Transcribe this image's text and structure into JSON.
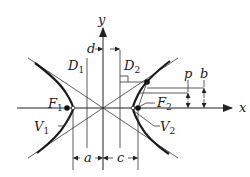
{
  "diagram": {
    "axes": {
      "x_label": "x",
      "y_label": "y"
    },
    "labels": {
      "D1": {
        "main": "D",
        "sub": "1"
      },
      "D2": {
        "main": "D",
        "sub": "2"
      },
      "F1": {
        "main": "F",
        "sub": "1"
      },
      "F2": {
        "main": "F",
        "sub": "2"
      },
      "V1": {
        "main": "V",
        "sub": "1"
      },
      "V2": {
        "main": "V",
        "sub": "2"
      },
      "d": "d",
      "a": "a",
      "c": "c",
      "p": "p",
      "b": "b"
    },
    "colors": {
      "ink": "#222222",
      "background": "#ffffff"
    }
  }
}
